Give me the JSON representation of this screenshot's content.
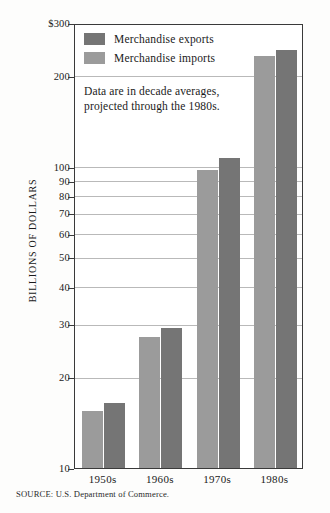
{
  "chart_data": {
    "type": "bar",
    "title": "",
    "subtitle": "",
    "xlabel": "",
    "ylabel": "BILLIONS OF DOLLARS",
    "scale": "log",
    "ylim": [
      10,
      300
    ],
    "grid": true,
    "legend_position": "top-left",
    "categories": [
      "1950s",
      "1960s",
      "1970s",
      "1980s"
    ],
    "series": [
      {
        "name": "Merchandise exports",
        "color": "#757575",
        "values": [
          16.7,
          29.5,
          108,
          247
        ]
      },
      {
        "name": "Merchandise imports",
        "color": "#9b9b9b",
        "values": [
          15.6,
          27.5,
          99,
          236
        ]
      }
    ],
    "y_ticks": [
      {
        "value": 300,
        "label": "$300"
      },
      {
        "value": 200,
        "label": "200"
      },
      {
        "value": 100,
        "label": "100"
      },
      {
        "value": 90,
        "label": "90"
      },
      {
        "value": 80,
        "label": "80"
      },
      {
        "value": 70,
        "label": "70"
      },
      {
        "value": 60,
        "label": "60"
      },
      {
        "value": 50,
        "label": "50"
      },
      {
        "value": 40,
        "label": "40"
      },
      {
        "value": 30,
        "label": "30"
      },
      {
        "value": 20,
        "label": "20"
      },
      {
        "value": 10,
        "label": "10"
      }
    ],
    "annotation_lines": [
      "Data are in decade averages,",
      "projected through the 1980s."
    ],
    "source": "SOURCE: U.S. Department of Commerce."
  },
  "legend": {
    "items": [
      {
        "label": "Merchandise exports",
        "swatch": "exports"
      },
      {
        "label": "Merchandise imports",
        "swatch": "imports"
      }
    ]
  }
}
